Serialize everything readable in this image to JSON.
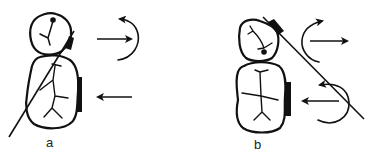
{
  "figure": {
    "panels": [
      {
        "id": "a",
        "label": "a",
        "elements": [
          "premolar-crown",
          "molar-crown",
          "long-axis-line",
          "premolar-attachment",
          "molar-attachment",
          "force-arrow-right",
          "moment-arrow-counterclockwise",
          "force-arrow-left"
        ]
      },
      {
        "id": "b",
        "label": "b",
        "elements": [
          "premolar-crown",
          "molar-crown",
          "diagonal-line",
          "premolar-attachment",
          "molar-attachment",
          "moment-arrow-upper",
          "force-arrow-right",
          "moment-arrow-lower",
          "force-arrow-left"
        ]
      }
    ],
    "colors": {
      "ink": "#111111",
      "background": "#ffffff"
    }
  }
}
